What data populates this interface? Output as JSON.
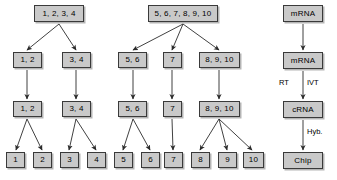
{
  "diagram": {
    "style": {
      "box_fill": "#c9c9c9",
      "box_border": "#3a3a3a",
      "arrow_color": "#2b2b2b",
      "background": "#ffffff"
    },
    "nodes": [
      {
        "id": "L-r1",
        "label": "1, 2, 3, 4",
        "x": 34,
        "y": 5,
        "w": 50,
        "h": 17
      },
      {
        "id": "L-r2a",
        "label": "1, 2",
        "x": 13,
        "y": 52,
        "w": 29,
        "h": 16
      },
      {
        "id": "L-r2b",
        "label": "3, 4",
        "x": 62,
        "y": 52,
        "w": 29,
        "h": 16
      },
      {
        "id": "L-r3a",
        "label": "1, 2",
        "x": 13,
        "y": 101,
        "w": 29,
        "h": 16
      },
      {
        "id": "L-r3b",
        "label": "3, 4",
        "x": 62,
        "y": 101,
        "w": 29,
        "h": 16
      },
      {
        "id": "L-l1",
        "label": "1",
        "x": 6,
        "y": 152,
        "w": 19,
        "h": 16
      },
      {
        "id": "L-l2",
        "label": "2",
        "x": 33,
        "y": 152,
        "w": 19,
        "h": 16
      },
      {
        "id": "L-l3",
        "label": "3",
        "x": 60,
        "y": 152,
        "w": 19,
        "h": 16
      },
      {
        "id": "L-l4",
        "label": "4",
        "x": 87,
        "y": 152,
        "w": 19,
        "h": 16
      },
      {
        "id": "R-r1",
        "label": "5, 6, 7, 8, 9, 10",
        "x": 148,
        "y": 5,
        "w": 70,
        "h": 17
      },
      {
        "id": "R-r2a",
        "label": "5, 6",
        "x": 118,
        "y": 52,
        "w": 29,
        "h": 16
      },
      {
        "id": "R-r2b",
        "label": "7",
        "x": 163,
        "y": 52,
        "w": 19,
        "h": 16
      },
      {
        "id": "R-r2c",
        "label": "8, 9, 10",
        "x": 199,
        "y": 52,
        "w": 41,
        "h": 16
      },
      {
        "id": "R-r3a",
        "label": "5, 6",
        "x": 118,
        "y": 101,
        "w": 29,
        "h": 16
      },
      {
        "id": "R-r3b",
        "label": "7",
        "x": 163,
        "y": 101,
        "w": 19,
        "h": 16
      },
      {
        "id": "R-r3c",
        "label": "8, 9, 10",
        "x": 199,
        "y": 101,
        "w": 41,
        "h": 16
      },
      {
        "id": "R-l5",
        "label": "5",
        "x": 114,
        "y": 152,
        "w": 19,
        "h": 16
      },
      {
        "id": "R-l6",
        "label": "6",
        "x": 141,
        "y": 152,
        "w": 19,
        "h": 16
      },
      {
        "id": "R-l7",
        "label": "7",
        "x": 164,
        "y": 152,
        "w": 19,
        "h": 16
      },
      {
        "id": "R-l8",
        "label": "8",
        "x": 191,
        "y": 152,
        "w": 19,
        "h": 16
      },
      {
        "id": "R-l9",
        "label": "9",
        "x": 218,
        "y": 152,
        "w": 19,
        "h": 16
      },
      {
        "id": "R-l10",
        "label": "10",
        "x": 243,
        "y": 152,
        "w": 21,
        "h": 16
      },
      {
        "id": "P-1",
        "label": "mRNA",
        "x": 283,
        "y": 5,
        "w": 40,
        "h": 17
      },
      {
        "id": "P-2",
        "label": "mRNA",
        "x": 283,
        "y": 52,
        "w": 40,
        "h": 17
      },
      {
        "id": "P-3",
        "label": "cRNA",
        "x": 283,
        "y": 101,
        "w": 40,
        "h": 17
      },
      {
        "id": "P-4",
        "label": "Chip",
        "x": 283,
        "y": 152,
        "w": 40,
        "h": 17
      }
    ],
    "edges": [
      {
        "from": "L-r1",
        "to": "L-r2a",
        "x1": 59,
        "y1": 24,
        "x2": 27,
        "y2": 50
      },
      {
        "from": "L-r1",
        "to": "L-r2b",
        "x1": 59,
        "y1": 24,
        "x2": 76,
        "y2": 50
      },
      {
        "from": "L-r2a",
        "to": "L-r3a",
        "x1": 27,
        "y1": 70,
        "x2": 27,
        "y2": 99
      },
      {
        "from": "L-r2b",
        "to": "L-r3b",
        "x1": 76,
        "y1": 70,
        "x2": 76,
        "y2": 99
      },
      {
        "from": "L-r3a",
        "to": "L-l1",
        "x1": 27,
        "y1": 119,
        "x2": 16,
        "y2": 150
      },
      {
        "from": "L-r3a",
        "to": "L-l2",
        "x1": 27,
        "y1": 119,
        "x2": 42,
        "y2": 150
      },
      {
        "from": "L-r3b",
        "to": "L-l3",
        "x1": 76,
        "y1": 119,
        "x2": 69,
        "y2": 150
      },
      {
        "from": "L-r3b",
        "to": "L-l4",
        "x1": 76,
        "y1": 119,
        "x2": 96,
        "y2": 150
      },
      {
        "from": "R-r1",
        "to": "R-r2a",
        "x1": 183,
        "y1": 24,
        "x2": 133,
        "y2": 50
      },
      {
        "from": "R-r1",
        "to": "R-r2b",
        "x1": 183,
        "y1": 24,
        "x2": 172,
        "y2": 50
      },
      {
        "from": "R-r1",
        "to": "R-r2c",
        "x1": 183,
        "y1": 24,
        "x2": 219,
        "y2": 50
      },
      {
        "from": "R-r2a",
        "to": "R-r3a",
        "x1": 133,
        "y1": 70,
        "x2": 133,
        "y2": 99
      },
      {
        "from": "R-r2b",
        "to": "R-r3b",
        "x1": 172,
        "y1": 70,
        "x2": 172,
        "y2": 99
      },
      {
        "from": "R-r2c",
        "to": "R-r3c",
        "x1": 219,
        "y1": 70,
        "x2": 219,
        "y2": 99
      },
      {
        "from": "R-r3a",
        "to": "R-l5",
        "x1": 133,
        "y1": 119,
        "x2": 123,
        "y2": 150
      },
      {
        "from": "R-r3a",
        "to": "R-l6",
        "x1": 133,
        "y1": 119,
        "x2": 150,
        "y2": 150
      },
      {
        "from": "R-r3b",
        "to": "R-l7",
        "x1": 172,
        "y1": 119,
        "x2": 173,
        "y2": 150
      },
      {
        "from": "R-r3c",
        "to": "R-l8",
        "x1": 219,
        "y1": 119,
        "x2": 200,
        "y2": 150
      },
      {
        "from": "R-r3c",
        "to": "R-l9",
        "x1": 219,
        "y1": 119,
        "x2": 227,
        "y2": 150
      },
      {
        "from": "R-r3c",
        "to": "R-l10",
        "x1": 219,
        "y1": 119,
        "x2": 252,
        "y2": 150
      },
      {
        "from": "P-1",
        "to": "P-2",
        "x1": 303,
        "y1": 24,
        "x2": 303,
        "y2": 50
      },
      {
        "from": "P-2",
        "to": "P-3",
        "x1": 303,
        "y1": 71,
        "x2": 303,
        "y2": 99
      },
      {
        "from": "P-3",
        "to": "P-4",
        "x1": 303,
        "y1": 120,
        "x2": 303,
        "y2": 150
      }
    ],
    "edge_labels": [
      {
        "id": "lbl-rt",
        "text": "RT",
        "x": 279,
        "y": 79
      },
      {
        "id": "lbl-ivt",
        "text": "IVT",
        "x": 307,
        "y": 79
      },
      {
        "id": "lbl-hyb",
        "text": "Hyb.",
        "x": 307,
        "y": 128
      }
    ]
  }
}
